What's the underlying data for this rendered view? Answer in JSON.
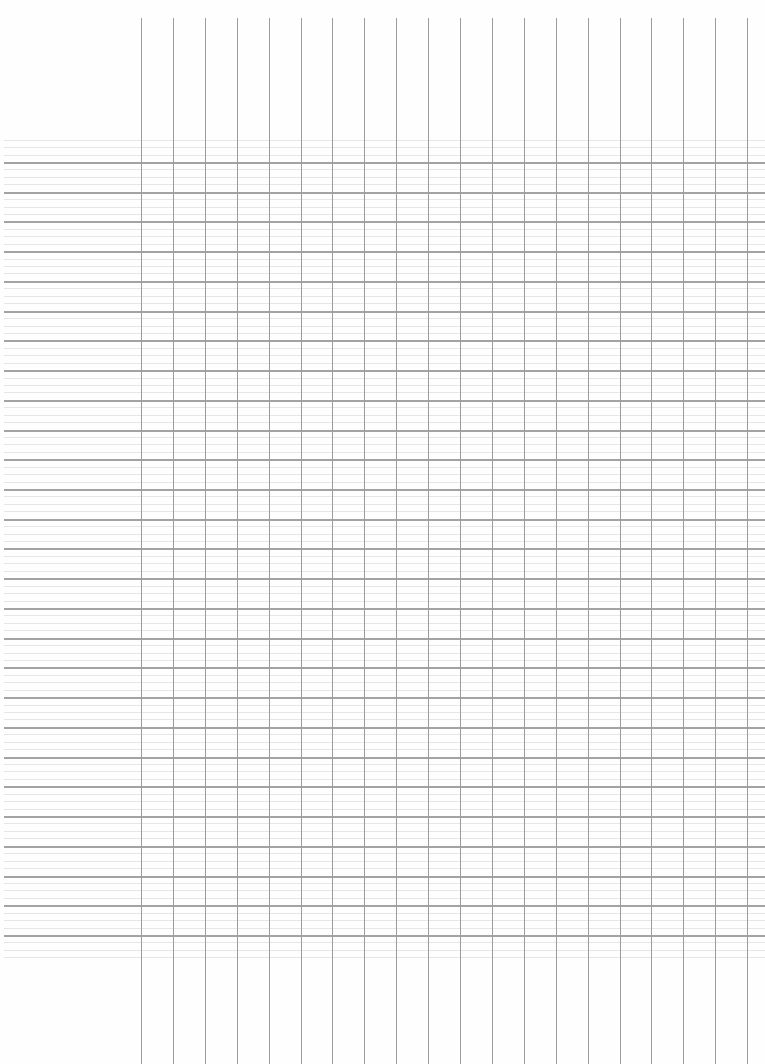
{
  "page": {
    "type": "blank ruled grid sheet",
    "width": 765,
    "height": 1064,
    "background": "#ffffff"
  },
  "grid": {
    "colors": {
      "major_line": "#a3a3a3",
      "minor_line": "#e6e6e6",
      "vertical_line": "#9c9c9c"
    },
    "horizontal": {
      "first_major_y": 162,
      "major_step": 29.73,
      "major_count": 27,
      "minor_per_gap": 3,
      "minor_lines_before_first": 3,
      "minor_lines_after_last": 3
    },
    "vertical": {
      "first_x": 141,
      "step": 31.9,
      "count": 20,
      "top_y": 18,
      "bottom_y": 1064
    }
  }
}
